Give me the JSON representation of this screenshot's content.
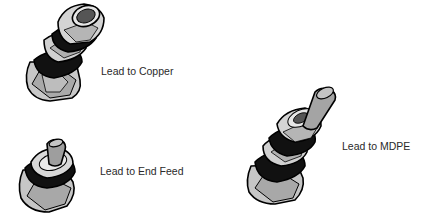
{
  "diagram": {
    "items": [
      {
        "id": "copper",
        "label": "Lead to Copper",
        "icon": "compression-fitting-icon"
      },
      {
        "id": "endfeed",
        "label": "Lead to End Feed",
        "icon": "end-feed-fitting-icon"
      },
      {
        "id": "mdpe",
        "label": "Lead to MDPE",
        "icon": "mdpe-fitting-icon"
      }
    ]
  },
  "colors": {
    "metal_light": "#d9d9d9",
    "metal_mid": "#b3b3b3",
    "metal_dark": "#7a7a7a",
    "outline": "#000000",
    "ring": "#111111",
    "text": "#2a2a2a"
  }
}
